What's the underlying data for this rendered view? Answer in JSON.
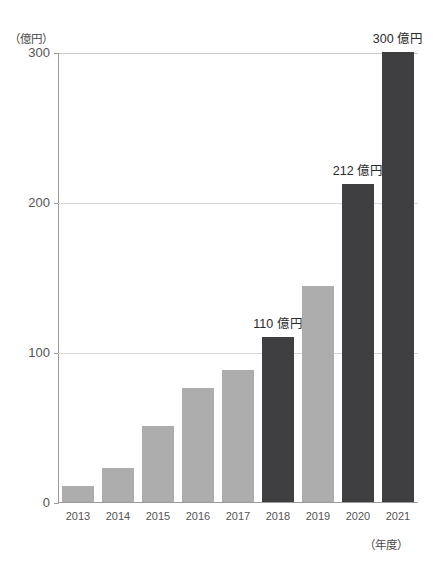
{
  "chart_data": {
    "type": "bar",
    "title": "",
    "xlabel": "（年度）",
    "ylabel": "（億円）",
    "categories": [
      "2013",
      "2014",
      "2015",
      "2016",
      "2017",
      "2018",
      "2019",
      "2020",
      "2021"
    ],
    "values": [
      11,
      23,
      51,
      76,
      88,
      110,
      144,
      212,
      300
    ],
    "ylim": [
      0,
      300
    ],
    "yticks": [
      "0",
      "100",
      "200",
      "300"
    ],
    "ytick_values": [
      0,
      100,
      200,
      300
    ],
    "grid": true,
    "legend": "none",
    "bar_colors": [
      "light",
      "light",
      "light",
      "light",
      "light",
      "dark",
      "light",
      "dark",
      "dark"
    ],
    "data_labels": [
      {
        "category": "2018",
        "text": "110 億円"
      },
      {
        "category": "2020",
        "text": "212 億円"
      },
      {
        "category": "2021",
        "text": "300 億円"
      }
    ]
  },
  "colors": {
    "bar_light": "#adadad",
    "bar_dark": "#3f3f42",
    "axis": "#9a9a9a",
    "gridline": "#d8d8d8",
    "frame_top": "#c9c9c9",
    "text": "#555555",
    "label_text": "#2b2b2b"
  }
}
